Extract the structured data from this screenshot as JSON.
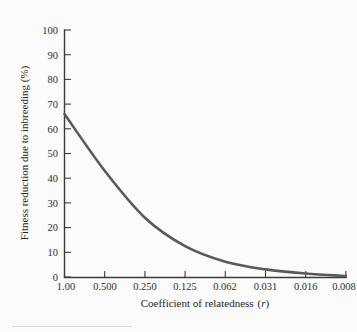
{
  "figure": {
    "background_color": "#fbfbfb",
    "curve_color": "#5a5a5a",
    "axis_color": "#3a3a3a"
  },
  "chart_data": {
    "type": "line",
    "title": "",
    "xlabel": "Coefficient of relatedness (r)",
    "xlabel_text": "Coefficient of relatedness",
    "xlabel_symbol": "r",
    "ylabel": "Fitness reduction due to inbreeding (%)",
    "categories": [
      "1.00",
      "0.500",
      "0.250",
      "0.125",
      "0.062",
      "0.031",
      "0.016",
      "0.008"
    ],
    "x": [
      1.0,
      0.5,
      0.25,
      0.125,
      0.062,
      0.031,
      0.016,
      0.008
    ],
    "values": [
      66,
      43,
      24,
      12.5,
      6.2,
      3.1,
      1.4,
      0.4
    ],
    "series": [
      {
        "name": "Fitness reduction due to inbreeding",
        "values": [
          66,
          43,
          24,
          12.5,
          6.2,
          3.1,
          1.4,
          0.4
        ]
      }
    ],
    "xtick_labels": [
      "1.00",
      "0.500",
      "0.250",
      "0.125",
      "0.062",
      "0.031",
      "0.016",
      "0.008"
    ],
    "ytick_labels": [
      "0",
      "10",
      "20",
      "30",
      "40",
      "50",
      "60",
      "70",
      "80",
      "90",
      "100"
    ],
    "ytick_values": [
      0,
      10,
      20,
      30,
      40,
      50,
      60,
      70,
      80,
      90,
      100
    ],
    "ylim": [
      0,
      100
    ],
    "xscale": "evenly-spaced-halving",
    "grid": false,
    "legend": "none",
    "annotations": []
  }
}
